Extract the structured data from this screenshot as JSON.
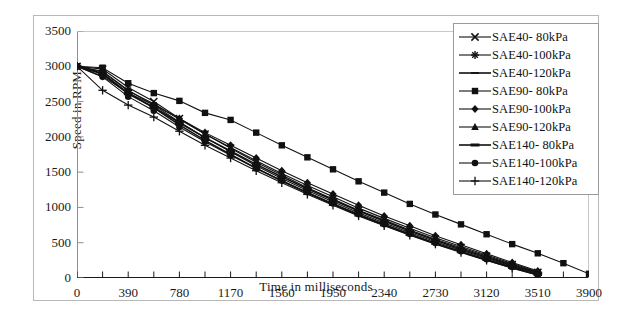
{
  "chart_data": {
    "type": "line",
    "title": "",
    "xlabel": "Time in milliseconds",
    "ylabel": "Speed  in RPM",
    "xlim": [
      0,
      3900
    ],
    "ylim": [
      0,
      3500
    ],
    "xticks": [
      0,
      390,
      780,
      1170,
      1560,
      1950,
      2340,
      2730,
      3120,
      3510,
      3900
    ],
    "xtick_labels": [
      "0",
      "390",
      "780",
      "1170",
      "1560",
      "1950",
      "2340",
      "2730",
      "3120",
      "3510",
      "3900"
    ],
    "yticks": [
      0,
      500,
      1000,
      1500,
      2000,
      2500,
      3000,
      3500
    ],
    "ytick_labels": [
      "0",
      "500",
      "1000",
      "1500",
      "2000",
      "2500",
      "3000",
      "3500"
    ],
    "minor_xtick_step": 195,
    "grid": false,
    "legend_position": "upper-right-inside",
    "line_color": "#111111",
    "x": [
      0,
      195,
      390,
      585,
      780,
      975,
      1170,
      1365,
      1560,
      1755,
      1950,
      2145,
      2340,
      2535,
      2730,
      2925,
      3120,
      3315,
      3510,
      3705,
      3900
    ],
    "series": [
      {
        "name": "SAE40- 80kPa",
        "marker": "x-cross",
        "values": [
          3000,
          2960,
          2700,
          2500,
          2260,
          2040,
          1840,
          1640,
          1460,
          1280,
          1120,
          960,
          820,
          680,
          550,
          430,
          310,
          190,
          80,
          null,
          null
        ]
      },
      {
        "name": "SAE40-100kPa",
        "marker": "asterisk",
        "values": [
          3000,
          2930,
          2660,
          2450,
          2210,
          1990,
          1790,
          1590,
          1410,
          1240,
          1080,
          925,
          780,
          645,
          515,
          395,
          280,
          165,
          60,
          null,
          null
        ]
      },
      {
        "name": "SAE40-120kPa",
        "marker": "dash",
        "values": [
          3000,
          2900,
          2620,
          2410,
          2170,
          1950,
          1750,
          1555,
          1375,
          1205,
          1045,
          890,
          750,
          615,
          490,
          370,
          255,
          145,
          45,
          null,
          null
        ]
      },
      {
        "name": "SAE90- 80kPa",
        "marker": "square",
        "values": [
          3000,
          2980,
          2760,
          2620,
          2510,
          2340,
          2240,
          2060,
          1880,
          1710,
          1540,
          1370,
          1210,
          1050,
          900,
          760,
          620,
          480,
          350,
          210,
          60
        ]
      },
      {
        "name": "SAE90-100kPa",
        "marker": "diamond",
        "values": [
          3000,
          2860,
          2620,
          2450,
          2260,
          2060,
          1880,
          1700,
          1520,
          1350,
          1190,
          1030,
          880,
          740,
          600,
          470,
          345,
          220,
          100,
          null,
          null
        ]
      },
      {
        "name": "SAE90-120kPa",
        "marker": "triangle",
        "values": [
          3000,
          2920,
          2650,
          2470,
          2250,
          2040,
          1850,
          1660,
          1480,
          1310,
          1150,
          990,
          845,
          705,
          570,
          445,
          325,
          205,
          90,
          null,
          null
        ]
      },
      {
        "name": "SAE140- 80kPa",
        "marker": "thick-dash",
        "values": [
          3000,
          2890,
          2610,
          2420,
          2200,
          1990,
          1800,
          1610,
          1435,
          1265,
          1105,
          950,
          805,
          665,
          535,
          410,
          295,
          180,
          70,
          null,
          null
        ]
      },
      {
        "name": "SAE140-100kPa",
        "marker": "circle",
        "values": [
          3000,
          2850,
          2570,
          2370,
          2140,
          1930,
          1740,
          1555,
          1380,
          1215,
          1055,
          905,
          760,
          625,
          495,
          380,
          265,
          155,
          50,
          null,
          null
        ]
      },
      {
        "name": "SAE140-120kPa",
        "marker": "plus",
        "values": [
          3000,
          2660,
          2450,
          2280,
          2080,
          1880,
          1700,
          1520,
          1350,
          1185,
          1030,
          880,
          740,
          605,
          480,
          360,
          250,
          140,
          40,
          null,
          null
        ]
      }
    ]
  }
}
